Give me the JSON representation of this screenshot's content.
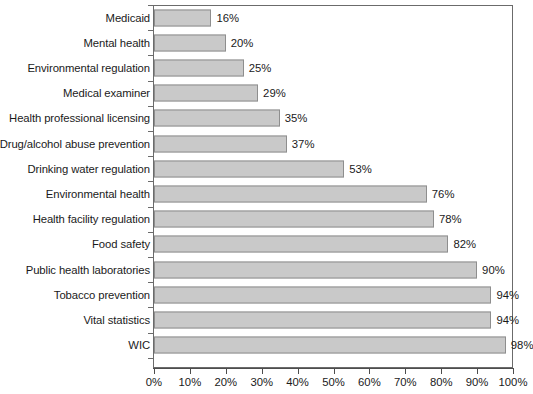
{
  "chart_data": {
    "type": "bar",
    "orientation": "horizontal",
    "title": "",
    "subtitle": "",
    "xlabel": "",
    "ylabel": "",
    "xlim": [
      0,
      110
    ],
    "axis_max_tick": 100,
    "grid": false,
    "legend": null,
    "bar_color": "#c9c9c9",
    "bar_border_color": "#8e8e8e",
    "axis_color": "#4d4d4d",
    "frame_color": "#6b6b6b",
    "text_color": "#1a1a1a",
    "value_suffix": "%",
    "categories": [
      "Medicaid",
      "Mental health",
      "Environmental regulation",
      "Medical examiner",
      "Health professional licensing",
      "Drug/alcohol abuse prevention",
      "Drinking water regulation",
      "Environmental health",
      "Health facility regulation",
      "Food safety",
      "Public health laboratories",
      "Tobacco prevention",
      "Vital statistics",
      "WIC"
    ],
    "values": [
      16,
      20,
      25,
      29,
      35,
      37,
      53,
      76,
      78,
      82,
      90,
      94,
      94,
      98
    ],
    "value_labels": [
      "16%",
      "20%",
      "25%",
      "29%",
      "35%",
      "37%",
      "53%",
      "76%",
      "78%",
      "82%",
      "90%",
      "94%",
      "94%",
      "98%"
    ],
    "xticks": [
      0,
      10,
      20,
      30,
      40,
      50,
      60,
      70,
      80,
      90,
      100
    ],
    "xtick_labels": [
      "0%",
      "10%",
      "20%",
      "30%",
      "40%",
      "50%",
      "60%",
      "70%",
      "80%",
      "90%",
      "100%"
    ]
  }
}
